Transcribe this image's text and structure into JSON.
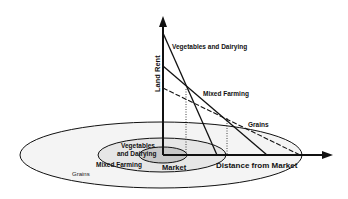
{
  "axes": {
    "y_label": "Land Rent",
    "x_label": "Distance from Market"
  },
  "rent_lines": [
    {
      "name": "Vegetables and Dairying",
      "style": "solid"
    },
    {
      "name": "Mixed Farming",
      "style": "solid"
    },
    {
      "name": "Grains",
      "style": "dashed"
    }
  ],
  "rings": {
    "center": "Market",
    "inner_line1": "Vegetables",
    "inner_line2": "and Dairying",
    "middle": "Mixed Farming",
    "outer": "Grains"
  },
  "colors": {
    "line": "#111111",
    "inner_fill": "#c8c8c8",
    "middle_fill": "#e6e6e6",
    "outer_fill": "#f4f4f4"
  }
}
